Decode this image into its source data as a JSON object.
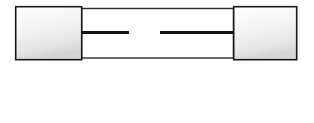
{
  "figure": {
    "alt_text": "Cross-section line drawing of a glass cartridge fuse with two metal end caps and a broken filament wire inside",
    "background_color": "#ffffff",
    "width": 314,
    "height": 123
  },
  "colors": {
    "outline": "#1a1a1a",
    "glass_outline": "#2b2b2b",
    "cap_fill_light": "#fdfdfd",
    "cap_fill_mid": "#ededed",
    "cap_fill_dark": "#d2d2d2",
    "filament": "#111111",
    "glass_fill": "#ffffff"
  },
  "parts": {
    "left_cap": {
      "label": "left-end-cap",
      "x": 15,
      "y": 6,
      "width": 67,
      "height": 54
    },
    "right_cap": {
      "label": "right-end-cap",
      "x": 233,
      "y": 6,
      "width": 64,
      "height": 54
    },
    "glass_body": {
      "label": "glass-tube-body",
      "x": 81,
      "y": 8,
      "width": 153,
      "height": 50
    },
    "filament_left": {
      "label": "filament-left-segment",
      "x1": 81,
      "x2": 129,
      "y": 32,
      "thickness": 3
    },
    "filament_right": {
      "label": "filament-right-segment",
      "x1": 160,
      "x2": 234,
      "y": 32,
      "thickness": 3
    },
    "break_gap": {
      "label": "filament-break-gap",
      "x1": 129,
      "x2": 160,
      "y": 32
    }
  }
}
